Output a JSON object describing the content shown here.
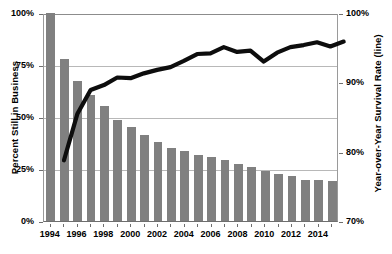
{
  "chart_data": {
    "type": "bar",
    "title": "",
    "subtitle": "",
    "xlabel": "",
    "ylabel": "Percent Still in Business",
    "y2label": "Year-over-Year Survival Rate (line)",
    "grid": true,
    "legend": "none",
    "categories": [
      "1994",
      "1995",
      "1996",
      "1997",
      "1998",
      "1999",
      "2000",
      "2001",
      "2002",
      "2003",
      "2004",
      "2005",
      "2006",
      "2007",
      "2008",
      "2009",
      "2010",
      "2011",
      "2012",
      "2013",
      "2014",
      "2015"
    ],
    "xtick_labels": [
      "1994",
      "1996",
      "1998",
      "2000",
      "2002",
      "2004",
      "2006",
      "2008",
      "2010",
      "2012",
      "2014"
    ],
    "ylim": [
      0,
      100
    ],
    "ytick_labels": [
      "0%",
      "25%",
      "50%",
      "75%",
      "100%"
    ],
    "ytick_values": [
      0,
      25,
      50,
      75,
      100
    ],
    "y2lim": [
      70,
      100
    ],
    "y2tick_labels": [
      "70%",
      "80%",
      "90%",
      "100%"
    ],
    "y2tick_values": [
      70,
      80,
      90,
      100
    ],
    "series": [
      {
        "name": "Percent Still in Business",
        "type": "bar",
        "axis": "left",
        "color": "#808080",
        "values": [
          100.0,
          77.8,
          67.2,
          60.5,
          55.3,
          48.6,
          45.0,
          41.3,
          38.1,
          34.9,
          33.6,
          31.7,
          30.7,
          29.2,
          27.5,
          25.8,
          23.9,
          22.6,
          21.5,
          19.9,
          19.5,
          19.0
        ]
      },
      {
        "name": "Year-over-Year Survival Rate",
        "type": "line",
        "axis": "right",
        "color": "#0d0d0d",
        "x_start_index": 1,
        "values": [
          78.8,
          85.5,
          89.0,
          89.7,
          90.8,
          90.7,
          91.4,
          91.9,
          92.3,
          93.2,
          94.2,
          94.3,
          95.2,
          94.5,
          94.7,
          93.1,
          94.4,
          95.2,
          95.5,
          95.9,
          95.3,
          96.0
        ]
      }
    ]
  }
}
